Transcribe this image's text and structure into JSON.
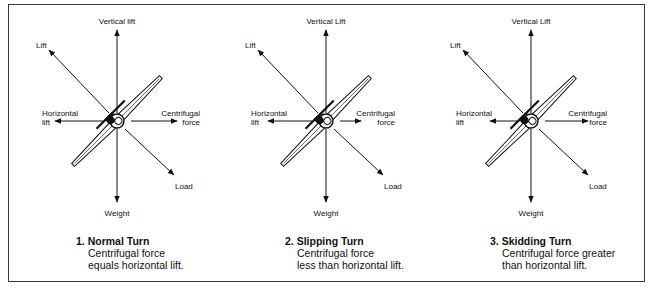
{
  "figure": {
    "border_color": "#3a3a3a",
    "ink_color": "#111111",
    "panels": [
      {
        "id": "normal",
        "center": [
          117,
          121
        ],
        "labels": {
          "vertical": "Vertical lift",
          "lift": "Lift",
          "horizontal_1": "Horizontal",
          "horizontal_2": "lift",
          "centrifugal_1": "Centrifugal",
          "centrifugal_2": "force",
          "load": "Load",
          "weight": "Weight"
        },
        "arrows": {
          "horizontal_lift_tip_x": 55,
          "centrifugal_tip_x": 177
        },
        "caption": {
          "number": "1.",
          "title": "Normal Turn",
          "line1": "Centrifugal force",
          "line2": "equals horizontal lift."
        }
      },
      {
        "id": "slipping",
        "center": [
          326,
          121
        ],
        "labels": {
          "vertical": "Vertical Lift",
          "lift": "Lift",
          "horizontal_1": "Horizontal",
          "horizontal_2": "lift",
          "centrifugal_1": "Centrifugal",
          "centrifugal_2": "force",
          "load": "Load",
          "weight": "Weight"
        },
        "arrows": {
          "horizontal_lift_tip_x": 268,
          "centrifugal_tip_x": 361
        },
        "caption": {
          "number": "2.",
          "title": "Slipping Turn",
          "line1": "Centrifugal force",
          "line2": "less than horizontal lift."
        }
      },
      {
        "id": "skidding",
        "center": [
          531,
          121
        ],
        "labels": {
          "vertical": "Vertical Lift",
          "lift": "Lift",
          "horizontal_1": "Horizontal",
          "horizontal_2": "lift",
          "centrifugal_1": "Centrifugal",
          "centrifugal_2": "force",
          "load": "Load",
          "weight": "Weight"
        },
        "arrows": {
          "horizontal_lift_tip_x": 490,
          "centrifugal_tip_x": 588
        },
        "caption": {
          "number": "3.",
          "title": "Skidding Turn",
          "line1": "Centrifugal force greater",
          "line2": "than horizontal lift."
        }
      }
    ]
  }
}
